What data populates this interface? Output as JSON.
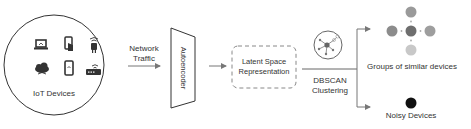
{
  "diagram": {
    "iot_group": {
      "label": "IoT Devices",
      "icons": [
        "laptop-icon",
        "touch-phone-icon",
        "smart-plug-icon",
        "cloud-wifi-icon",
        "smartphone-icon",
        "router-icon"
      ]
    },
    "edge_network": {
      "label_line1": "Network",
      "label_line2": "Traffic"
    },
    "autoencoder": {
      "label": "Autoencoder"
    },
    "latent": {
      "label_line1": "Latent Space",
      "label_line2": "Representation"
    },
    "dbscan": {
      "label_line1": "DBSCAN",
      "label_line2": "Clustering",
      "icon": "network-cluster-icon"
    },
    "outputs": {
      "groups": {
        "label": "Groups of similar devices",
        "dots": [
          {
            "position": "top",
            "color": "#9a9a9a"
          },
          {
            "position": "left",
            "color": "#8c8c8c"
          },
          {
            "position": "center",
            "color": "#6e6e6e"
          },
          {
            "position": "right",
            "color": "#9e9e9e"
          },
          {
            "position": "bottom",
            "color": "#c8c8c8"
          }
        ]
      },
      "noisy": {
        "label": "Noisy Devices",
        "dot_color": "#111111"
      }
    },
    "colors": {
      "stroke": "#333333",
      "arrow": "#777777",
      "dash": "#888888"
    }
  }
}
